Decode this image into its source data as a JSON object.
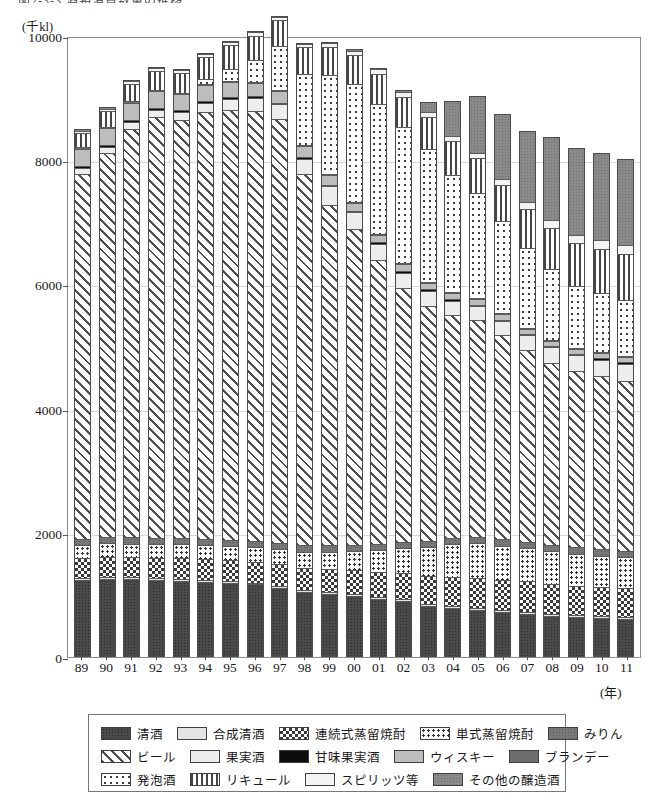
{
  "title": "図2-3-3 酒類消費数量の推移",
  "unit_label": "(千kl)",
  "xaxis_unit": "(年)",
  "yaxis": {
    "ticks": [
      "10000",
      "8000",
      "6000",
      "4000",
      "2000",
      "0"
    ],
    "min": 0,
    "max": 10000
  },
  "legend": {
    "rows": [
      [
        {
          "label": "清酒",
          "pattern": "p-seishu"
        },
        {
          "label": "合成清酒",
          "pattern": "p-goseiseishu"
        },
        {
          "label": "連続式蒸留焼酎",
          "pattern": "p-renzoku"
        },
        {
          "label": "単式蒸留焼酎",
          "pattern": "p-tanshiki"
        },
        {
          "label": "みりん",
          "pattern": "p-mirin"
        }
      ],
      [
        {
          "label": "ビール",
          "pattern": "p-beer"
        },
        {
          "label": "果実酒",
          "pattern": "p-kajitsu"
        },
        {
          "label": "甘味果実酒",
          "pattern": "p-kanmi"
        },
        {
          "label": "ウィスキー",
          "pattern": "p-whisky"
        },
        {
          "label": "ブランデー",
          "pattern": "p-brandy"
        }
      ],
      [
        {
          "label": "発泡酒",
          "pattern": "p-happoshu"
        },
        {
          "label": "リキュール",
          "pattern": "p-liqueur"
        },
        {
          "label": "スピリッツ等",
          "pattern": "p-spirits"
        },
        {
          "label": "その他の醸造酒",
          "pattern": "p-sonota"
        }
      ]
    ]
  },
  "chart_data": {
    "type": "bar",
    "stacked": true,
    "title": "図2-3-3 酒類消費数量の推移",
    "xlabel": "(年)",
    "ylabel": "(千kl)",
    "ylim": [
      0,
      10000
    ],
    "ytick_values": [
      0,
      2000,
      4000,
      6000,
      8000,
      10000
    ],
    "grid": true,
    "legend_position": "bottom",
    "categories": [
      "89",
      "90",
      "91",
      "92",
      "93",
      "94",
      "95",
      "96",
      "97",
      "98",
      "99",
      "00",
      "01",
      "02",
      "03",
      "04",
      "05",
      "06",
      "07",
      "08",
      "09",
      "10",
      "11"
    ],
    "series": [
      {
        "name": "清酒",
        "pattern": "p-seishu",
        "values": [
          1210,
          1230,
          1225,
          1215,
          1200,
          1180,
          1160,
          1140,
          1090,
          1020,
          990,
          950,
          910,
          880,
          800,
          760,
          730,
          690,
          660,
          630,
          610,
          600,
          590
        ]
      },
      {
        "name": "合成清酒",
        "pattern": "p-goseiseishu",
        "values": [
          30,
          30,
          30,
          30,
          30,
          30,
          30,
          30,
          30,
          30,
          30,
          30,
          30,
          30,
          30,
          30,
          30,
          30,
          30,
          30,
          30,
          30,
          30
        ]
      },
      {
        "name": "連続式蒸留焼酎",
        "pattern": "p-renzoku",
        "values": [
          330,
          330,
          330,
          330,
          340,
          340,
          340,
          340,
          350,
          360,
          370,
          390,
          400,
          420,
          450,
          470,
          490,
          500,
          500,
          490,
          480,
          470,
          460
        ]
      },
      {
        "name": "単式蒸留焼酎",
        "pattern": "p-tanshiki",
        "values": [
          210,
          215,
          215,
          215,
          220,
          225,
          230,
          235,
          245,
          260,
          280,
          310,
          350,
          400,
          470,
          540,
          560,
          550,
          540,
          530,
          520,
          510,
          500
        ]
      },
      {
        "name": "みりん",
        "pattern": "p-mirin",
        "values": [
          100,
          100,
          100,
          100,
          100,
          100,
          100,
          100,
          100,
          100,
          100,
          100,
          100,
          100,
          100,
          100,
          100,
          100,
          100,
          100,
          100,
          100,
          100
        ]
      },
      {
        "name": "ビール",
        "pattern": "p-beer",
        "values": [
          5900,
          6200,
          6600,
          6800,
          6750,
          6900,
          6950,
          6950,
          6850,
          6000,
          5500,
          5100,
          4600,
          4100,
          3800,
          3600,
          3500,
          3300,
          3100,
          2950,
          2850,
          2800,
          2750
        ]
      },
      {
        "name": "果実酒",
        "pattern": "p-kajitsu",
        "values": [
          90,
          100,
          110,
          120,
          130,
          150,
          180,
          200,
          230,
          250,
          300,
          280,
          260,
          250,
          240,
          230,
          230,
          230,
          240,
          250,
          260,
          270,
          280
        ]
      },
      {
        "name": "甘味果実酒",
        "pattern": "p-kanmi",
        "values": [
          30,
          30,
          30,
          30,
          30,
          30,
          30,
          30,
          30,
          30,
          30,
          25,
          25,
          25,
          25,
          25,
          25,
          25,
          25,
          25,
          25,
          25,
          25
        ]
      },
      {
        "name": "ウィスキー",
        "pattern": "p-whisky",
        "values": [
          280,
          280,
          280,
          270,
          260,
          250,
          230,
          210,
          190,
          170,
          150,
          130,
          120,
          110,
          100,
          95,
          90,
          85,
          80,
          80,
          80,
          85,
          90
        ]
      },
      {
        "name": "ブランデー",
        "pattern": "p-brandy",
        "values": [
          25,
          25,
          25,
          25,
          25,
          20,
          20,
          20,
          15,
          15,
          15,
          10,
          10,
          10,
          10,
          10,
          10,
          10,
          10,
          10,
          10,
          10,
          10
        ]
      },
      {
        "name": "発泡酒",
        "pattern": "p-happoshu",
        "values": [
          0,
          0,
          0,
          0,
          0,
          80,
          200,
          350,
          700,
          1150,
          1600,
          1900,
          2100,
          2200,
          2150,
          1900,
          1700,
          1500,
          1300,
          1150,
          1000,
          950,
          900
        ]
      },
      {
        "name": "リキュール",
        "pattern": "p-liqueur",
        "values": [
          230,
          250,
          280,
          300,
          320,
          350,
          380,
          400,
          420,
          430,
          450,
          470,
          490,
          500,
          520,
          540,
          560,
          580,
          620,
          660,
          700,
          720,
          740
        ]
      },
      {
        "name": "スピリッツ等",
        "pattern": "p-spirits",
        "values": [
          40,
          40,
          45,
          45,
          50,
          50,
          55,
          55,
          60,
          60,
          65,
          70,
          75,
          80,
          85,
          90,
          95,
          100,
          110,
          120,
          130,
          140,
          150
        ]
      },
      {
        "name": "その他の醸造酒",
        "pattern": "p-sonota",
        "values": [
          20,
          20,
          20,
          20,
          20,
          20,
          20,
          20,
          20,
          20,
          20,
          20,
          20,
          20,
          150,
          560,
          920,
          1050,
          1150,
          1350,
          1400,
          1400,
          1400
        ]
      }
    ]
  }
}
